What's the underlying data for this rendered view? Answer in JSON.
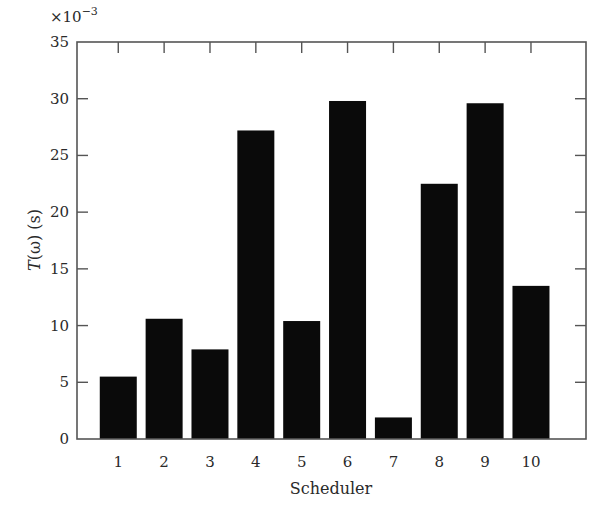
{
  "chart_data": {
    "type": "bar",
    "title": "",
    "xlabel": "Scheduler",
    "ylabel": "T(ω) (s)",
    "ylabel_parts": {
      "italic": "T",
      "rest": "(ω) (s)"
    },
    "y_multiplier": "×10",
    "y_multiplier_exp": "−3",
    "categories": [
      "1",
      "2",
      "3",
      "4",
      "5",
      "6",
      "7",
      "8",
      "9",
      "10"
    ],
    "values": [
      5.5,
      10.6,
      7.9,
      27.2,
      10.4,
      29.8,
      1.9,
      22.5,
      29.6,
      13.5
    ],
    "values_scaled_note": "values are in units of 10^-3 s",
    "ylim": [
      0,
      35
    ],
    "yticks": [
      0,
      5,
      10,
      15,
      20,
      25,
      30,
      35
    ],
    "xlim": [
      0.1,
      11.2
    ],
    "grid": false,
    "legend": null,
    "bar_color": "#0a0a0a",
    "axis_color": "#555555"
  }
}
